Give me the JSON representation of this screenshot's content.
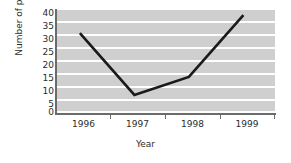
{
  "chart_data": {
    "type": "line",
    "title": "",
    "xlabel": "Year",
    "ylabel": "Number of pupils",
    "categories": [
      "1996",
      "1997",
      "1998",
      "1999"
    ],
    "x": [
      1996,
      1997,
      1998,
      1999
    ],
    "values": [
      31,
      7,
      14,
      38
    ],
    "series": [
      {
        "name": "Number of pupils",
        "values": [
          31,
          7,
          14,
          38
        ]
      }
    ],
    "ylim": [
      0,
      40
    ],
    "ytick_labels": [
      "0",
      "5",
      "10",
      "15",
      "20",
      "25",
      "30",
      "35",
      "40"
    ],
    "ytick_values": [
      0,
      5,
      10,
      15,
      20,
      25,
      30,
      35,
      40
    ],
    "ystep": 5,
    "grid": "horizontal-white-on-gray-bands",
    "legend": "none",
    "line_color": "#1a1a1a",
    "plot_background": "#cfcfcf",
    "gridline_color": "#ffffff",
    "axis_color": "#6b6b6b"
  }
}
